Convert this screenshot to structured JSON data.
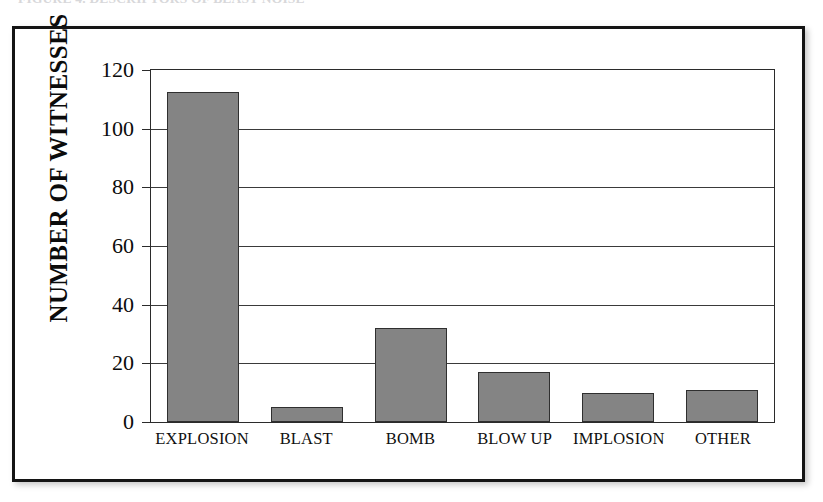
{
  "figure": {
    "cut_off_title": "FIGURE 4. DESCRIPTORS OF BLAST NOISE"
  },
  "chart_data": {
    "type": "bar",
    "title": "",
    "xlabel": "",
    "ylabel": "NUMBER OF WITNESSES",
    "categories": [
      "EXPLOSION",
      "BLAST",
      "BOMB",
      "BLOW UP",
      "IMPLOSION",
      "OTHER"
    ],
    "values": [
      112,
      5,
      32,
      17,
      10,
      11
    ],
    "ylim": [
      0,
      120
    ],
    "yticks": [
      0,
      20,
      40,
      60,
      80,
      100,
      120
    ],
    "ytick_labels": [
      "0",
      "20",
      "40",
      "60",
      "80",
      "100",
      "120"
    ],
    "grid": "horizontal",
    "legend": "none",
    "bar_color": "#848484",
    "bar_border_color": "#2f2f2f",
    "axis_color": "#2b2b2b",
    "frame_color": "#141414"
  }
}
